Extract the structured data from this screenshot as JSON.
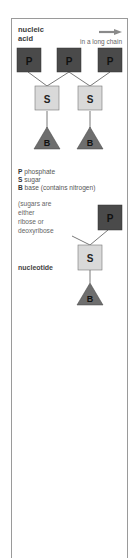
{
  "diagram": {
    "title": "nucleic acid",
    "title_lines": [
      "nucleic",
      "acid"
    ],
    "chain_label": "in a long chain",
    "arrow": "right-arrow",
    "chain": {
      "phosphates": [
        {
          "label": "P"
        },
        {
          "label": "P"
        },
        {
          "label": "P"
        }
      ],
      "sugars": [
        {
          "label": "S"
        },
        {
          "label": "S"
        }
      ],
      "bases": [
        {
          "label": "B"
        },
        {
          "label": "B"
        }
      ]
    },
    "legend": [
      {
        "key": "P",
        "text": "phosphate"
      },
      {
        "key": "S",
        "text": "sugar"
      },
      {
        "key": "B",
        "text": "base (contains nitrogen)"
      }
    ],
    "note_lines": [
      "(sugars are",
      "either",
      "ribose or",
      "deoxyribose"
    ],
    "nucleotide": {
      "label": "nucleotide",
      "phosphate": "P",
      "sugar": "S",
      "base": "B"
    },
    "colors": {
      "phosphate": "#4a4a4a",
      "sugar": "#d9d9d9",
      "base": "#6e6e6e",
      "frame": "#9a9a9a",
      "line": "#555555",
      "arrow": "#8a8a8a"
    }
  }
}
